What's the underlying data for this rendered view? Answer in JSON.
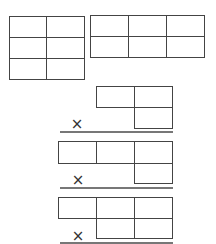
{
  "figures": [
    {
      "id": "grid-2x3",
      "cols": 2,
      "rows": 3
    },
    {
      "id": "grid-3x2",
      "cols": 3,
      "rows": 2
    },
    {
      "id": "multiplication-layout-1"
    },
    {
      "id": "multiplication-layout-2"
    },
    {
      "id": "multiplication-layout-3"
    }
  ],
  "symbols": {
    "times": "×"
  },
  "colors": {
    "line": "#444444",
    "rule": "#777777"
  }
}
